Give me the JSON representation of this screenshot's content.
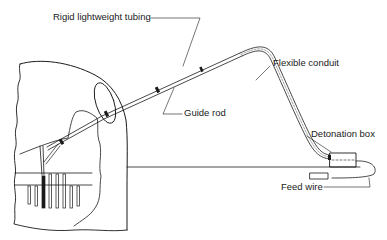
{
  "diagram": {
    "type": "technical-illustration",
    "colors": {
      "line": "#1a1a1a",
      "background": "#ffffff"
    },
    "labels": {
      "rigid_tubing": "Rigid lightweight tubing",
      "flexible_conduit": "Flexible conduit",
      "guide_rod": "Guide rod",
      "detonation_box": "Detonation box",
      "feed_wire": "Feed wire"
    }
  }
}
